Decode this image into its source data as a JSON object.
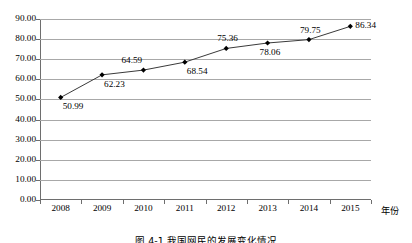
{
  "chart_data": {
    "type": "line",
    "title": "",
    "xlabel": "年份",
    "ylabel": "",
    "categories": [
      "2008",
      "2009",
      "2010",
      "2011",
      "2012",
      "2013",
      "2014",
      "2015"
    ],
    "values": [
      50.99,
      62.23,
      64.59,
      68.54,
      75.36,
      78.06,
      79.75,
      86.34
    ],
    "point_labels": [
      "50.99",
      "62.23",
      "64.59",
      "68.54",
      "75.36",
      "78.06",
      "79.75",
      "86.34"
    ],
    "label_positions": [
      "below-right",
      "below-right",
      "above-left",
      "below-right",
      "above",
      "below",
      "above",
      "right"
    ],
    "ylim": [
      0,
      90
    ],
    "ytick_step": 10,
    "ytick_labels": [
      "0.00",
      "10.00",
      "20.00",
      "30.00",
      "40.00",
      "50.00",
      "60.00",
      "70.00",
      "80.00",
      "90.00"
    ],
    "grid": true,
    "legend": "none",
    "marker": "diamond",
    "line_color": "#3a3a3a",
    "marker_color": "#000000",
    "grid_color": "#a8a8a8",
    "axis_color": "#6e6e6e"
  },
  "caption": {
    "text": "图 4-1  我国网民的发展变化情况"
  }
}
